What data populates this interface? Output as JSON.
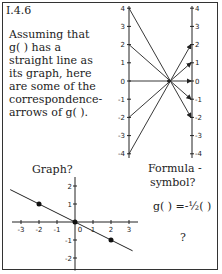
{
  "code": "I.4.6",
  "paragraph": [
    "Assuming that",
    "g( ) has a",
    "straight line as",
    "its graph, here",
    "are some of the",
    "correspondence-",
    "arrows of g( )."
  ],
  "arrows_diagram": {
    "axis_ticks": [
      "4",
      "3",
      "2",
      "1",
      "0",
      "-1",
      "-2",
      "-3",
      "-4"
    ],
    "arrows": [
      {
        "from": 4,
        "to": -2
      },
      {
        "from": 2,
        "to": -1
      },
      {
        "from": 0,
        "to": 0
      },
      {
        "from": -2,
        "to": 1
      },
      {
        "from": -4,
        "to": 2
      }
    ]
  },
  "graph": {
    "title": "Graph?",
    "x_ticks": [
      "-3",
      "-2",
      "-1",
      "0",
      "1",
      "2",
      "3"
    ],
    "y_ticks": [
      "2",
      "1",
      "-1",
      "-2"
    ],
    "points": [
      [
        -2,
        1
      ],
      [
        0,
        0
      ],
      [
        2,
        -1
      ]
    ],
    "slope": -0.5
  },
  "formula": {
    "title_line1": "Formula -",
    "title_line2": "symbol?",
    "expression": "g( ) =-½( )",
    "question": "?"
  }
}
